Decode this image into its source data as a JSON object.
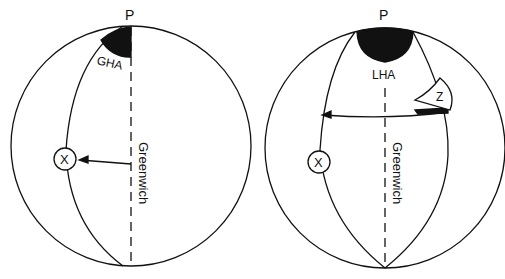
{
  "diagram": {
    "left_sphere": {
      "pole_label": "P",
      "angle_label": "GHA",
      "meridian_label": "Greenwich",
      "body_label": "X"
    },
    "right_sphere": {
      "pole_label": "P",
      "angle_label": "LHA",
      "meridian_label": "Greenwich",
      "body_label": "X",
      "zenith_label": "Z"
    },
    "colors": {
      "line": "#111111",
      "fill": "#111111",
      "background": "#ffffff"
    }
  }
}
